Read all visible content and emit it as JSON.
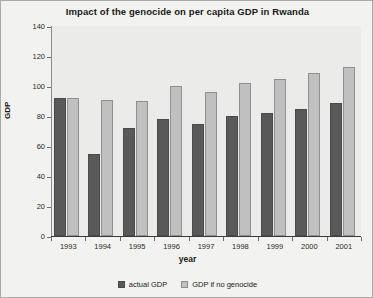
{
  "chart_data": {
    "type": "bar",
    "title": "Impact of the genocide on per capita GDP in Rwanda",
    "xlabel": "year",
    "ylabel": "GDP",
    "categories": [
      "1993",
      "1994",
      "1995",
      "1996",
      "1997",
      "1998",
      "1999",
      "2000",
      "2001"
    ],
    "series": [
      {
        "name": "actual GDP",
        "color": "#595959",
        "values": [
          92,
          55,
          72,
          78,
          75,
          80,
          82,
          85,
          89
        ]
      },
      {
        "name": "GDP if no genocide",
        "color": "#c0c0c0",
        "values": [
          92,
          91,
          90,
          100,
          96,
          102,
          105,
          109,
          113
        ]
      }
    ],
    "ylim": [
      0,
      140
    ],
    "ytick_step": 20,
    "yticks": [
      "0",
      "20",
      "40",
      "60",
      "80",
      "100",
      "120",
      "140"
    ],
    "grid": false,
    "legend_position": "bottom"
  }
}
